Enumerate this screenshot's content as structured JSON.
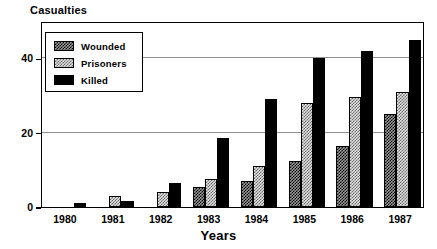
{
  "chart_data": {
    "type": "bar",
    "title": "Casualties",
    "xlabel": "Years",
    "ylabel": "",
    "categories": [
      "1980",
      "1981",
      "1982",
      "1983",
      "1984",
      "1985",
      "1986",
      "1987"
    ],
    "series": [
      {
        "name": "Wounded",
        "values": [
          0,
          0,
          0,
          5.5,
          7,
          12.5,
          16.5,
          25
        ]
      },
      {
        "name": "Prisoners",
        "values": [
          0,
          3,
          4,
          7.5,
          11,
          28,
          29.5,
          31
        ]
      },
      {
        "name": "Killed",
        "values": [
          1,
          1.5,
          6.5,
          18.5,
          29,
          40,
          42,
          45
        ]
      }
    ],
    "ylim": [
      0,
      50
    ],
    "yticks": [
      0,
      20,
      40
    ],
    "ytick_labels": [
      "0",
      "20",
      "40"
    ],
    "grid": true,
    "gridlines_at": [
      20,
      40
    ],
    "legend_position": "top-left",
    "legend_entries": [
      "Wounded",
      "Prisoners",
      "Killed"
    ],
    "colors": {
      "wounded": "#9a9a9a",
      "prisoners": "#e2e2e2",
      "killed": "#000000",
      "axis": "#000000",
      "gridline": "#8e8e8e",
      "background": "#ffffff"
    }
  }
}
